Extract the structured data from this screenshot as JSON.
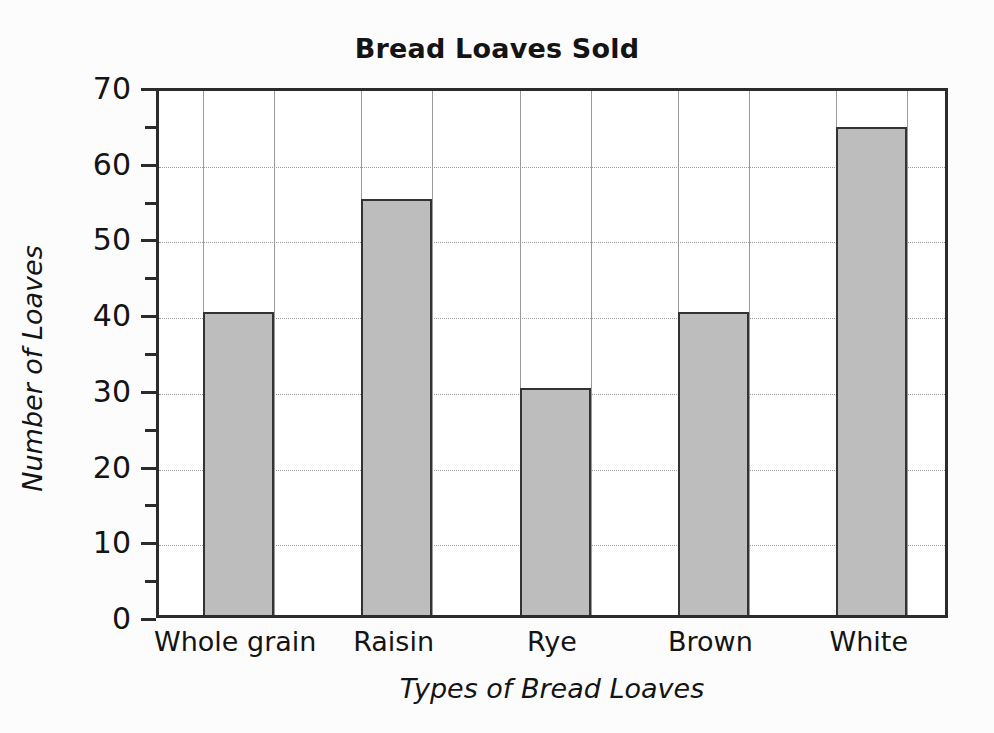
{
  "chart_data": {
    "type": "bar",
    "title": "Bread Loaves Sold",
    "xlabel": "Types of Bread Loaves",
    "ylabel": "Number of Loaves",
    "categories": [
      "Whole grain",
      "Raisin",
      "Rye",
      "Brown",
      "White"
    ],
    "values": [
      40,
      55,
      30,
      40,
      64.5
    ],
    "ylim": [
      0,
      70
    ],
    "y_major_step": 10,
    "y_minor_step": 5,
    "y_ticks": [
      0,
      10,
      20,
      30,
      40,
      50,
      60,
      70
    ],
    "y_tick_labels": [
      "0",
      "10",
      "20",
      "30",
      "40",
      "50",
      "60",
      "70"
    ],
    "y_minor_ticks": [
      5,
      15,
      25,
      35,
      45,
      55,
      65
    ],
    "grid": true,
    "grid_horizontal": true,
    "grid_vertical": true,
    "legend": null,
    "series": [
      {
        "name": "Number of Loaves",
        "values": [
          40,
          55,
          30,
          40,
          64.5
        ]
      }
    ],
    "bar_fill_color": "#bdbdbd",
    "bar_border_color": "#333333",
    "background_color": "#fcfcfc",
    "plot_background_color": "#ffffff",
    "axis_color": "#2b2b2b",
    "grid_color": "#9a9a9a",
    "text_color": "#141414"
  }
}
